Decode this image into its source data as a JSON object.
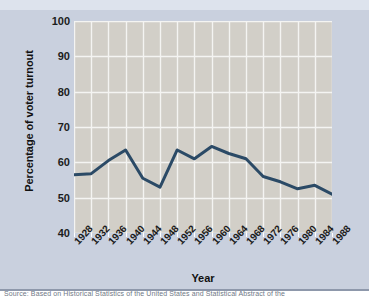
{
  "figure": {
    "background_color": "#c9d0de",
    "plot_background_color": "#d2cfc8",
    "grid_color": "#f4f4f2",
    "line_color": "#2b4a66"
  },
  "caption": {
    "text": "Source: Based on Historical Statistics of the United States and Statistical Abstract of the"
  },
  "chart_data": {
    "type": "line",
    "title": "",
    "subtitle": "",
    "xlabel": "Year",
    "ylabel": "Percentage of voter turnout",
    "categories": [
      "1928",
      "1932",
      "1936",
      "1940",
      "1944",
      "1948",
      "1952",
      "1956",
      "1960",
      "1964",
      "1968",
      "1972",
      "1976",
      "1980",
      "1984",
      "1988"
    ],
    "values": [
      56.5,
      56.8,
      60.5,
      63.5,
      55.5,
      53.0,
      63.5,
      61.0,
      64.5,
      62.5,
      61.0,
      56.0,
      54.5,
      52.5,
      53.5,
      51.0
    ],
    "ylim": [
      40,
      100
    ],
    "yticks": [
      40,
      50,
      60,
      70,
      80,
      90,
      100
    ],
    "ytick_labels": [
      "40",
      "50",
      "60",
      "70",
      "80",
      "90",
      "100"
    ],
    "grid": true,
    "legend": false,
    "legend_position": "none",
    "line_color": "#2b4a66",
    "line_width": 3
  }
}
